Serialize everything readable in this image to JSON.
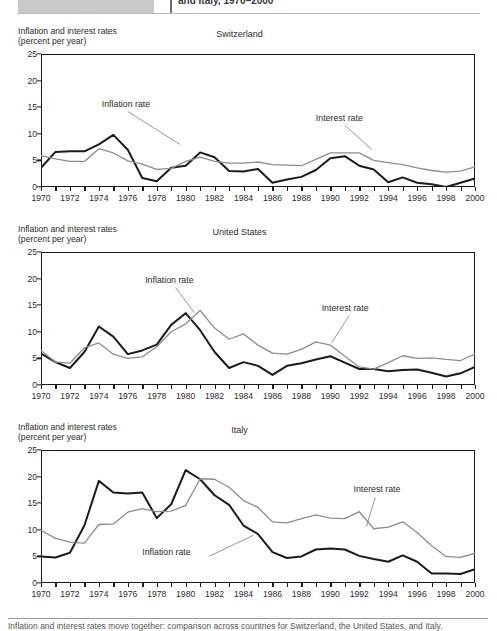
{
  "header": {
    "caption": "and Italy, 1970–2000",
    "icon": "grey-placeholder-block"
  },
  "footer": {
    "caption": "Inflation and interest rates move together: comparison across countries for Switzerland, the United States, and Italy."
  },
  "axis": {
    "y_label_line1": "Inflation and interest rates",
    "y_label_line2": "(percent per year)",
    "yticks": [
      0,
      5,
      10,
      15,
      20,
      25
    ],
    "xticks": [
      1970,
      1972,
      1974,
      1976,
      1978,
      1980,
      1982,
      1984,
      1986,
      1988,
      1990,
      1992,
      1994,
      1996,
      1998,
      2000
    ],
    "xtick_all": [
      1970,
      1971,
      1972,
      1973,
      1974,
      1975,
      1976,
      1977,
      1978,
      1979,
      1980,
      1981,
      1982,
      1983,
      1984,
      1985,
      1986,
      1987,
      1988,
      1989,
      1990,
      1991,
      1992,
      1993,
      1994,
      1995,
      1996,
      1997,
      1998,
      1999,
      2000
    ],
    "ylim": [
      0,
      25
    ],
    "xlim": [
      1970,
      2000
    ]
  },
  "series_labels": {
    "inflation": "Inflation rate",
    "interest": "Interest rate"
  },
  "colors": {
    "inflation": "#1a1a1a",
    "interest": "#8c8c8c",
    "frame": "#1a1a1a",
    "leader": "#8c8c8c",
    "text": "#2b2b2b"
  },
  "chart_data": [
    {
      "type": "line",
      "title": "Switzerland",
      "xlabel": "",
      "ylabel": "Inflation and interest rates (percent per year)",
      "xlim": [
        1970,
        2000
      ],
      "ylim": [
        0,
        25
      ],
      "grid": false,
      "legend": "annotations",
      "x": [
        1970,
        1971,
        1972,
        1973,
        1974,
        1975,
        1976,
        1977,
        1978,
        1979,
        1980,
        1981,
        1982,
        1983,
        1984,
        1985,
        1986,
        1987,
        1988,
        1989,
        1990,
        1991,
        1992,
        1993,
        1994,
        1995,
        1996,
        1997,
        1998,
        1999,
        2000
      ],
      "series": [
        {
          "name": "Inflation rate",
          "color": "#1a1a1a",
          "values": [
            3.6,
            6.6,
            6.7,
            6.7,
            8.0,
            9.8,
            7.0,
            1.7,
            1.1,
            3.6,
            4.0,
            6.5,
            5.6,
            3.0,
            2.9,
            3.4,
            0.8,
            1.4,
            1.9,
            3.2,
            5.4,
            5.8,
            4.0,
            3.3,
            0.9,
            1.8,
            0.8,
            0.5,
            0.0,
            0.8,
            1.6
          ]
        },
        {
          "name": "Interest rate",
          "color": "#8c8c8c",
          "values": [
            5.9,
            5.3,
            4.8,
            4.8,
            7.2,
            6.4,
            4.9,
            4.3,
            3.3,
            3.5,
            4.8,
            5.6,
            4.8,
            4.5,
            4.5,
            4.7,
            4.2,
            4.1,
            4.0,
            5.2,
            6.4,
            6.4,
            6.4,
            5.0,
            4.6,
            4.2,
            3.6,
            3.1,
            2.8,
            3.0,
            3.8
          ]
        }
      ],
      "annotations": [
        {
          "text": "Inflation rate",
          "x": 1974.2,
          "y": 15.5
        },
        {
          "text": "Interest rate",
          "x": 1989.0,
          "y": 12.8
        }
      ]
    },
    {
      "type": "line",
      "title": "United States",
      "xlabel": "",
      "ylabel": "Inflation and interest rates (percent per year)",
      "xlim": [
        1970,
        2000
      ],
      "ylim": [
        0,
        25
      ],
      "grid": false,
      "legend": "annotations",
      "x": [
        1970,
        1971,
        1972,
        1973,
        1974,
        1975,
        1976,
        1977,
        1978,
        1979,
        1980,
        1981,
        1982,
        1983,
        1984,
        1985,
        1986,
        1987,
        1988,
        1989,
        1990,
        1991,
        1992,
        1993,
        1994,
        1995,
        1996,
        1997,
        1998,
        1999,
        2000
      ],
      "series": [
        {
          "name": "Inflation rate",
          "color": "#1a1a1a",
          "values": [
            5.9,
            4.3,
            3.2,
            6.2,
            11.0,
            9.1,
            5.8,
            6.5,
            7.6,
            11.3,
            13.5,
            10.3,
            6.2,
            3.2,
            4.3,
            3.6,
            1.9,
            3.6,
            4.1,
            4.8,
            5.4,
            4.2,
            3.0,
            3.0,
            2.6,
            2.8,
            2.9,
            2.3,
            1.6,
            2.2,
            3.4
          ]
        },
        {
          "name": "Interest rate",
          "color": "#8c8c8c",
          "values": [
            6.5,
            4.3,
            4.1,
            7.0,
            7.9,
            5.8,
            5.0,
            5.3,
            7.2,
            10.0,
            11.5,
            14.0,
            10.7,
            8.6,
            9.6,
            7.5,
            6.0,
            5.8,
            6.7,
            8.1,
            7.5,
            5.4,
            3.4,
            3.0,
            4.2,
            5.5,
            5.0,
            5.1,
            4.8,
            4.6,
            5.8
          ]
        }
      ],
      "annotations": [
        {
          "text": "Inflation rate",
          "x": 1977.2,
          "y": 19.6
        },
        {
          "text": "Interest rate",
          "x": 1989.4,
          "y": 14.2
        }
      ]
    },
    {
      "type": "line",
      "title": "Italy",
      "xlabel": "",
      "ylabel": "Inflation and interest rates (percent per year)",
      "xlim": [
        1970,
        2000
      ],
      "ylim": [
        0,
        25
      ],
      "grid": false,
      "legend": "annotations",
      "x": [
        1970,
        1971,
        1972,
        1973,
        1974,
        1975,
        1976,
        1977,
        1978,
        1979,
        1980,
        1981,
        1982,
        1983,
        1984,
        1985,
        1986,
        1987,
        1988,
        1989,
        1990,
        1991,
        1992,
        1993,
        1994,
        1995,
        1996,
        1997,
        1998,
        1999,
        2000
      ],
      "series": [
        {
          "name": "Inflation rate",
          "color": "#1a1a1a",
          "values": [
            5.0,
            4.8,
            5.7,
            10.8,
            19.2,
            17.0,
            16.8,
            17.0,
            12.2,
            14.8,
            21.2,
            19.5,
            16.5,
            14.7,
            10.8,
            9.2,
            5.8,
            4.7,
            5.0,
            6.3,
            6.5,
            6.3,
            5.1,
            4.5,
            4.0,
            5.2,
            4.0,
            1.8,
            1.8,
            1.7,
            2.6
          ]
        },
        {
          "name": "Interest rate",
          "color": "#8c8c8c",
          "values": [
            9.9,
            8.4,
            7.7,
            7.5,
            11.0,
            11.1,
            13.3,
            14.0,
            13.4,
            13.5,
            14.6,
            19.6,
            19.5,
            18.0,
            15.5,
            14.2,
            11.5,
            11.3,
            12.1,
            12.8,
            12.2,
            12.1,
            13.4,
            10.2,
            10.5,
            11.5,
            9.5,
            7.0,
            5.0,
            4.8,
            5.6
          ]
        }
      ],
      "annotations": [
        {
          "text": "Inflation rate",
          "x": 1977.0,
          "y": 5.6
        },
        {
          "text": "Interest rate",
          "x": 1991.6,
          "y": 17.4
        }
      ]
    }
  ]
}
